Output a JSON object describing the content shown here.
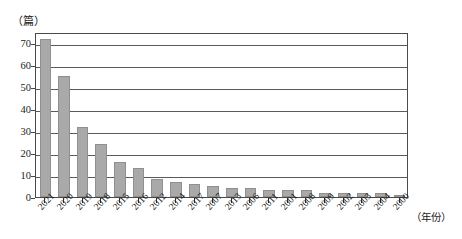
{
  "chart_data": {
    "type": "bar",
    "title": "",
    "subtitle": "",
    "xlabel": "（年份）",
    "ylabel": "（篇）",
    "ylim": [
      0,
      75
    ],
    "yticks": [
      0,
      10,
      20,
      30,
      40,
      50,
      60,
      70
    ],
    "ytick_labels": [
      "0",
      "10",
      "20",
      "30",
      "40",
      "50",
      "60",
      "70"
    ],
    "grid": true,
    "grid_axis": "y",
    "legend": false,
    "legend_position": "none",
    "bar_color": "#a9a9a9",
    "bar_edge_color": "#8f8f8f",
    "axis_color": "#4a4a4a",
    "categories": [
      "2021",
      "2020",
      "2019",
      "2018",
      "2015",
      "2016",
      "2012",
      "2014",
      "2017",
      "2007",
      "2013",
      "2006",
      "2011",
      "2001",
      "2008",
      "2009",
      "2002",
      "2003",
      "2004",
      "2000"
    ],
    "values": [
      72,
      55,
      32,
      24,
      16,
      13,
      8,
      7,
      6,
      5,
      4,
      4,
      3,
      3,
      3,
      2,
      2,
      2,
      2,
      1
    ]
  }
}
